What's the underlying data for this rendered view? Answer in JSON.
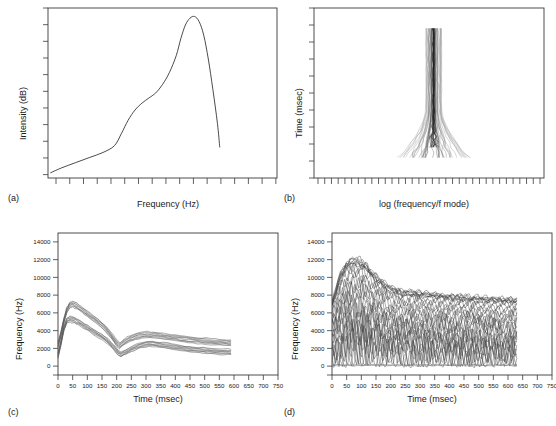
{
  "figure": {
    "background": "#ffffff",
    "ink": "#2b2b2b",
    "panel_count": 4
  },
  "panels": {
    "a": {
      "label": "(a)",
      "xlabel": "Frequency (Hz)",
      "ylabel": "Intensity (dB)",
      "x_tick_count": 17,
      "y_tick_count": 11,
      "tick_labels_shown": false
    },
    "b": {
      "label": "(b)",
      "xlabel": "log (frequency/f mode)",
      "ylabel": "Time (msec)",
      "x_tick_count": 34,
      "y_tick_count": 11,
      "tick_labels_shown": false
    },
    "c": {
      "label": "(c)",
      "xlabel": "Time (msec)",
      "ylabel": "Frequency (Hz)"
    },
    "d": {
      "label": "(d)",
      "xlabel": "Time (msec)",
      "ylabel": "Frequency (Hz)"
    }
  },
  "chart_data": [
    {
      "panel": "a",
      "type": "line",
      "title": "",
      "xlabel": "Frequency (Hz)",
      "ylabel": "Intensity (dB)",
      "xlim": [
        0,
        100
      ],
      "ylim": [
        0,
        100
      ],
      "grid": false,
      "legend": null,
      "xticks_labeled": [],
      "yticks_labeled": [],
      "xtick_positions": [
        3.5,
        9.5,
        15.5,
        21.5,
        27.5,
        33.5,
        39.5,
        45.5,
        51.5,
        57.5,
        63.5,
        69.5,
        75.5,
        81.5,
        87.5,
        93.5,
        99.5
      ],
      "ytick_positions": [
        2,
        11.8,
        21.6,
        31.4,
        41.2,
        51,
        60.8,
        70.6,
        80.4,
        90.2,
        100
      ],
      "series": [
        {
          "name": "spectrum",
          "x": [
            1,
            6,
            12,
            18,
            24,
            29,
            32,
            35,
            38,
            41,
            44,
            47,
            50,
            53,
            56,
            58,
            60,
            62,
            64,
            66,
            68,
            70,
            72,
            74,
            75
          ],
          "y": [
            3,
            6,
            9,
            12,
            15,
            19,
            26,
            34,
            40,
            44,
            47,
            50,
            55,
            62,
            72,
            82,
            90,
            94,
            95,
            92,
            84,
            70,
            52,
            32,
            18
          ]
        }
      ]
    },
    {
      "panel": "b",
      "type": "line",
      "title": "",
      "xlabel": "log (frequency/f mode)",
      "ylabel": "Time (msec)",
      "xlim": [
        0,
        100
      ],
      "ylim": [
        0,
        100
      ],
      "grid": false,
      "legend": null,
      "xticks_labeled": [],
      "yticks_labeled": [],
      "description": "dense bundle of time-frequency traces forming a narrow vertical plume centered near x=52, spanning y=12 to y=88, flaring into a wide root fan at the lower end",
      "plume": {
        "center_x": 52,
        "top_y": 12,
        "bottom_y": 88,
        "top_half_width": 3.5,
        "bottom_half_width": 16,
        "trace_count": 46
      }
    },
    {
      "panel": "c",
      "type": "line",
      "title": "",
      "xlabel": "Time (msec)",
      "ylabel": "Frequency (Hz)",
      "xlim": [
        0,
        750
      ],
      "ylim": [
        -1000,
        15000
      ],
      "grid": false,
      "legend": null,
      "xticks": [
        0,
        50,
        100,
        150,
        200,
        250,
        300,
        350,
        400,
        450,
        500,
        550,
        600,
        650,
        700,
        750
      ],
      "yticks": [
        0,
        2000,
        4000,
        6000,
        8000,
        10000,
        12000,
        14000
      ],
      "ytick_labels": [
        "0",
        "2000",
        "4000",
        "6000",
        "8000",
        "10000",
        "12000",
        "14000"
      ],
      "extra_minor_tick_below_zero": true,
      "series": [
        {
          "name": "upper formant bundle (F2)",
          "x": [
            0,
            10,
            20,
            30,
            40,
            50,
            65,
            80,
            100,
            120,
            140,
            160,
            180,
            200,
            210,
            225,
            245,
            265,
            285,
            305,
            325,
            350,
            375,
            400,
            430,
            460,
            490,
            520,
            550,
            575,
            590
          ],
          "y": [
            2400,
            3600,
            5100,
            6300,
            6900,
            7000,
            6750,
            6400,
            5900,
            5400,
            4900,
            4300,
            3500,
            2600,
            2300,
            2700,
            3100,
            3350,
            3500,
            3550,
            3500,
            3400,
            3300,
            3200,
            3050,
            2950,
            2850,
            2750,
            2680,
            2640,
            2620
          ],
          "band_half_width": 320,
          "trace_count": 10
        },
        {
          "name": "lower formant bundle (F1)",
          "x": [
            0,
            10,
            20,
            30,
            40,
            55,
            70,
            90,
            110,
            130,
            150,
            170,
            190,
            205,
            215,
            230,
            250,
            270,
            290,
            310,
            335,
            360,
            390,
            420,
            450,
            480,
            510,
            540,
            570,
            590
          ],
          "y": [
            1200,
            2600,
            4200,
            5100,
            5300,
            5200,
            4950,
            4500,
            4100,
            3700,
            3300,
            2800,
            2100,
            1500,
            1300,
            1550,
            1900,
            2200,
            2400,
            2500,
            2450,
            2350,
            2200,
            2050,
            1900,
            1800,
            1700,
            1650,
            1600,
            1580
          ],
          "band_half_width": 300,
          "trace_count": 10
        }
      ]
    },
    {
      "panel": "d",
      "type": "line",
      "title": "",
      "xlabel": "Time (msec)",
      "ylabel": "Frequency (Hz)",
      "xlim": [
        0,
        750
      ],
      "ylim": [
        -1000,
        15000
      ],
      "grid": false,
      "legend": null,
      "xticks": [
        0,
        50,
        100,
        150,
        200,
        250,
        300,
        350,
        400,
        450,
        500,
        550,
        600,
        650,
        700,
        750
      ],
      "yticks": [
        0,
        2000,
        4000,
        6000,
        8000,
        10000,
        12000,
        14000
      ],
      "ytick_labels": [
        "0",
        "2000",
        "4000",
        "6000",
        "8000",
        "10000",
        "12000",
        "14000"
      ],
      "extra_minor_tick_below_zero": true,
      "description": "dense set of highly jagged noise traces from 0 to about 630 msec; upper envelope rises to about 12200 Hz near 75 msec then decays to about 7500 Hz; traces fill downward to a floor near 0 Hz",
      "envelope": {
        "x": [
          0,
          25,
          50,
          75,
          100,
          125,
          150,
          175,
          200,
          240,
          280,
          320,
          360,
          400,
          450,
          500,
          550,
          600,
          630
        ],
        "upper": [
          7200,
          10200,
          11700,
          12200,
          11900,
          11000,
          10200,
          9500,
          8900,
          8500,
          8400,
          8300,
          8100,
          8000,
          7900,
          7800,
          7700,
          7600,
          7500
        ],
        "lower": [
          0,
          0,
          0,
          0,
          0,
          0,
          0,
          0,
          0,
          0,
          0,
          0,
          0,
          0,
          0,
          0,
          0,
          0,
          0
        ]
      },
      "trace_count": 26,
      "x_extent_msec": 630
    }
  ]
}
